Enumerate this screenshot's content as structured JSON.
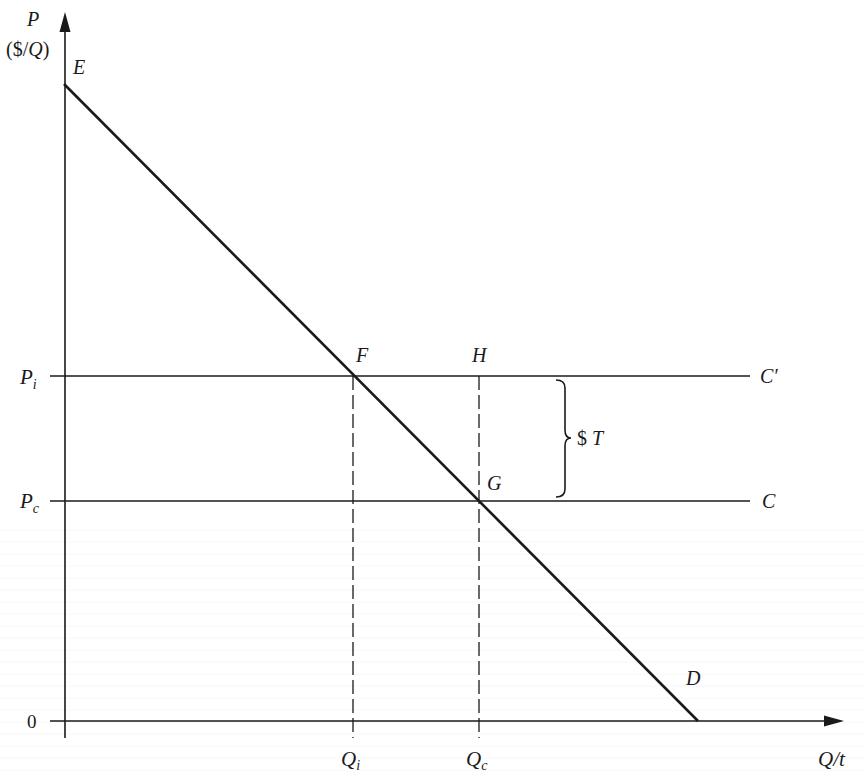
{
  "diagram": {
    "title": "",
    "axes": {
      "y_label_line1": "P",
      "y_label_line2_open": "($/",
      "y_label_line2_q": "Q",
      "y_label_line2_close": ")",
      "x_label": "Q/t",
      "origin_label": "0"
    },
    "price_levels": [
      {
        "id": "Pi",
        "label_main": "P",
        "label_sub": "i",
        "curve_label": "C′"
      },
      {
        "id": "Pc",
        "label_main": "P",
        "label_sub": "c",
        "curve_label": "C"
      }
    ],
    "quantity_levels": [
      {
        "id": "Qi",
        "label_main": "Q",
        "label_sub": "i"
      },
      {
        "id": "Qc",
        "label_main": "Q",
        "label_sub": "c"
      }
    ],
    "points": {
      "E": "E",
      "F": "F",
      "G": "G",
      "H": "H",
      "D": "D"
    },
    "tax_brace_label": "$T",
    "colors": {
      "ink": "#1a1a1a",
      "background": "#ffffff"
    }
  },
  "chart_data": {
    "type": "line",
    "title": "",
    "xlabel": "Q/t",
    "ylabel": "P ($/Q)",
    "grid": false,
    "legend": "none",
    "series": [
      {
        "name": "Demand D (from E to D)",
        "points": [
          [
            0,
            1.0
          ],
          [
            1.0,
            0.0
          ]
        ],
        "style": "solid"
      },
      {
        "name": "C′ (cost + tax)",
        "points": [
          [
            0,
            0.543
          ],
          [
            1.08,
            0.543
          ]
        ],
        "style": "solid"
      },
      {
        "name": "C (cost)",
        "points": [
          [
            0,
            0.347
          ],
          [
            1.08,
            0.347
          ]
        ],
        "style": "solid"
      },
      {
        "name": "Qi guide",
        "points": [
          [
            0.455,
            0
          ],
          [
            0.455,
            0.543
          ]
        ],
        "style": "dashed"
      },
      {
        "name": "Qc guide",
        "points": [
          [
            0.653,
            0
          ],
          [
            0.653,
            0.543
          ]
        ],
        "style": "dashed"
      }
    ],
    "annotations": [
      {
        "label": "E",
        "at": [
          0,
          1.0
        ]
      },
      {
        "label": "F",
        "at": [
          0.455,
          0.543
        ]
      },
      {
        "label": "H",
        "at": [
          0.653,
          0.543
        ]
      },
      {
        "label": "G",
        "at": [
          0.653,
          0.347
        ]
      },
      {
        "label": "D",
        "at": [
          1.0,
          0.0
        ]
      },
      {
        "label": "$T",
        "note": "brace spanning vertical gap between C′ and C"
      }
    ],
    "x_ticks": [
      "0",
      "Qi",
      "Qc"
    ],
    "y_ticks": [
      "0",
      "Pc",
      "Pi"
    ],
    "xlim": [
      0,
      1.2
    ],
    "ylim": [
      0,
      1.1
    ]
  }
}
